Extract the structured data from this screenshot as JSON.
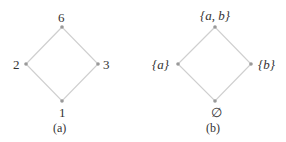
{
  "diagrams": [
    {
      "caption": "(a)",
      "nodes": {
        "top": "6",
        "left": "2",
        "right": "3",
        "bottom": "1"
      }
    },
    {
      "caption": "(b)",
      "nodes": {
        "top": "{a, b}",
        "left": "{a}",
        "right": "{b}",
        "bottom": "∅"
      }
    }
  ],
  "colors": {
    "edge": "#c8c8c8",
    "node": "#999999",
    "text": "#333333"
  }
}
